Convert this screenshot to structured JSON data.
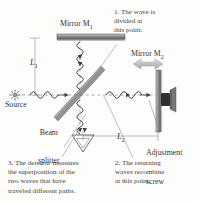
{
  "figure": {
    "name": "Michelson interferometer schematic",
    "background_color": "#fdfdfc",
    "ink_color": "#3a3a3a"
  },
  "labels": {
    "mirror1": "Mirror M",
    "mirror1_sub": "1",
    "mirror2": "Mirror M",
    "mirror2_sub": "2",
    "source": "Source",
    "beam_splitter_line1": "Beam",
    "beam_splitter_line2": "splitter",
    "adjustment_line1": "Adjustment",
    "adjustment_line2": "screw",
    "length1": "L",
    "length1_sub": "1",
    "length2": "L",
    "length2_sub": "2"
  },
  "notes": {
    "note1": "1. The wave is\n    divided at\n    this point.",
    "note2": "2. The returning\n    waves recombine\n    at this point.",
    "note3": "3. The detector measures\n    the superposition of the\n    two waves that have\n    traveled different paths."
  },
  "icons": {
    "source": "starburst-lamp-icon",
    "detector": "triangle-detector-icon",
    "mirror_move_arrow": "double-arrow-horizontal-icon",
    "adjustment_knob": "screw-knob-icon"
  },
  "colors": {
    "mirror_fill": "#8d8d8d",
    "mirror_edge": "#4a4a4a",
    "beam_line": "#55585c",
    "wave_line": "#3e3e3e",
    "arrow_gray": "#b9b9b9",
    "knob_dark": "#2e2e2e"
  }
}
